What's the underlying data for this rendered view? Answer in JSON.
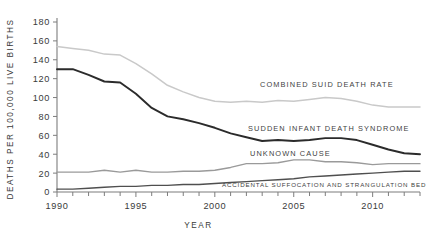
{
  "chart_data": {
    "type": "line",
    "title": "",
    "xlabel": "Year",
    "ylabel": "Deaths per 100,000 live births",
    "xlim": [
      1990,
      2013
    ],
    "ylim": [
      0,
      180
    ],
    "grid": false,
    "legend_position": "inline-right-of-series",
    "x": [
      1990,
      1991,
      1992,
      1993,
      1994,
      1995,
      1996,
      1997,
      1998,
      1999,
      2000,
      2001,
      2002,
      2003,
      2004,
      2005,
      2006,
      2007,
      2008,
      2009,
      2010,
      2011,
      2012,
      2013
    ],
    "x_tick_labels": [
      "1990",
      "1995",
      "2000",
      "2005",
      "2010"
    ],
    "x_tick_values": [
      1990,
      1995,
      2000,
      2005,
      2010
    ],
    "y_tick_labels": [
      "0",
      "20",
      "40",
      "60",
      "80",
      "100",
      "120",
      "140",
      "160",
      "180"
    ],
    "y_tick_values": [
      0,
      20,
      40,
      60,
      80,
      100,
      120,
      140,
      160,
      180
    ],
    "series": [
      {
        "name": "Combined suid death rate",
        "label": "Combined suid death rate",
        "color": "#c9c9c9",
        "width": 1.5,
        "values": [
          154,
          152,
          150,
          146,
          145,
          136,
          125,
          113,
          106,
          100,
          96,
          95,
          96,
          95,
          97,
          96,
          98,
          100,
          99,
          96,
          92,
          90,
          90,
          90
        ]
      },
      {
        "name": "Sudden infant death syndrome",
        "label": "Sudden infant death syndrome",
        "color": "#2b2b2b",
        "width": 1.9,
        "values": [
          130,
          130,
          124,
          117,
          116,
          104,
          89,
          80,
          77,
          73,
          68,
          62,
          58,
          54,
          55,
          54,
          55,
          57,
          57,
          55,
          50,
          45,
          41,
          40
        ]
      },
      {
        "name": "Unknown cause",
        "label": "Unknown cause",
        "color": "#9a9a9a",
        "width": 1.4,
        "values": [
          21,
          21,
          21,
          23,
          21,
          23,
          21,
          21,
          22,
          22,
          23,
          26,
          30,
          30,
          31,
          34,
          34,
          32,
          32,
          31,
          29,
          30,
          30,
          30
        ]
      },
      {
        "name": "Accidental suffocation and strangulation bed",
        "label": "Accidental suffocation and strangulation bed",
        "color": "#4f4f4f",
        "width": 1.4,
        "values": [
          3,
          3,
          4,
          5,
          6,
          6,
          7,
          7,
          8,
          8,
          9,
          10,
          11,
          12,
          13,
          14,
          16,
          17,
          18,
          19,
          20,
          21,
          22,
          22
        ]
      }
    ],
    "annotations": [
      {
        "text": "Combined suid death rate",
        "series": "Combined suid death rate",
        "x": 260,
        "y": 87
      },
      {
        "text": "Sudden infant death syndrome",
        "series": "Sudden infant death syndrome",
        "x": 248,
        "y": 131
      },
      {
        "text": "Unknown cause",
        "series": "Unknown cause",
        "x": 250,
        "y": 156
      },
      {
        "text": "Accidental suffocation and strangulation bed",
        "series": "Accidental suffocation and strangulation bed",
        "x": 222,
        "y": 187
      }
    ]
  },
  "axes": {
    "y_title": "Deaths per 100,000 live births",
    "x_title": "Year"
  }
}
